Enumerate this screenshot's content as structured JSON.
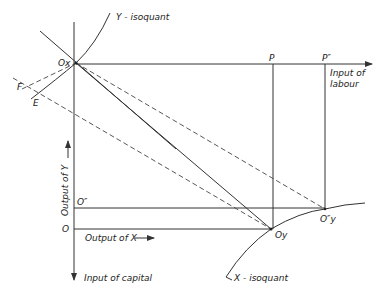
{
  "diagram": {
    "type": "edgeworth-box-production",
    "labels": {
      "y_isoquant": "Y - isoquant",
      "x_isoquant": "X - isoquant",
      "ox": "Ox",
      "oy": "Oy",
      "oy_double": "O″y",
      "o": "O",
      "o_double": "O″",
      "p": "P",
      "p_double": "P″",
      "f": "F",
      "e": "E",
      "input_labour_1": "Input of",
      "input_labour_2": "labour",
      "input_capital": "Input of capital",
      "output_x": "Output of X",
      "output_y": "Output of Y"
    },
    "points": {
      "Ox": [
        76,
        63
      ],
      "Oy": [
        271,
        229
      ],
      "O_double_y": [
        325,
        209
      ],
      "P": [
        273,
        64
      ],
      "P_double": [
        325,
        64
      ],
      "O": [
        73,
        229
      ],
      "O_double": [
        73,
        208
      ],
      "F": [
        27,
        86
      ],
      "E": [
        37,
        93
      ]
    },
    "colors": {
      "ink": "#333333",
      "background": "#ffffff"
    }
  }
}
